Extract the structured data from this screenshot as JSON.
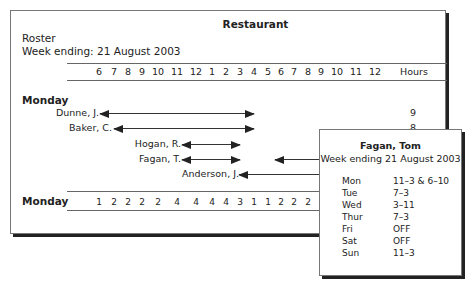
{
  "roster": {
    "title": "Restaurant",
    "subtitle": "Roster",
    "week_ending": "Week ending: 21 August 2003",
    "time_labels": [
      "6",
      "7",
      "8",
      "9",
      "10",
      "11",
      "12",
      "1",
      "2",
      "3",
      "4",
      "5",
      "6",
      "7",
      "8",
      "9",
      "10",
      "11",
      "12"
    ],
    "hours_header": "Hours",
    "day": "Monday",
    "staff": [
      {
        "name": "Dunne, J.",
        "shift": "6-4",
        "hours": "9"
      },
      {
        "name": "Baker, C.",
        "shift": "7-4",
        "hours": "8"
      },
      {
        "name": "Hogan, R.",
        "shift": "11-3",
        "hours": ""
      },
      {
        "name": "Fagan, T.",
        "shift": "11-3 & 6-",
        "hours": ""
      },
      {
        "name": "Anderson, J.",
        "shift": "3-",
        "hours": ""
      }
    ],
    "summary_label": "Monday",
    "summary_counts": [
      "1",
      "2",
      "2",
      "2",
      "2",
      "4",
      "4",
      "4",
      "4",
      "3",
      "1",
      "1",
      "2",
      "2",
      "2"
    ]
  },
  "popup": {
    "name": "Fagan, Tom",
    "week_ending": "Week ending 21 August 2003",
    "schedule": [
      {
        "day": "Mon",
        "shift": "11–3 & 6–10"
      },
      {
        "day": "Tue",
        "shift": "7–3"
      },
      {
        "day": "Wed",
        "shift": "3–11"
      },
      {
        "day": "Thur",
        "shift": "7–3"
      },
      {
        "day": "Fri",
        "shift": "OFF"
      },
      {
        "day": "Sat",
        "shift": "OFF"
      },
      {
        "day": "Sun",
        "shift": "11–3"
      }
    ]
  }
}
